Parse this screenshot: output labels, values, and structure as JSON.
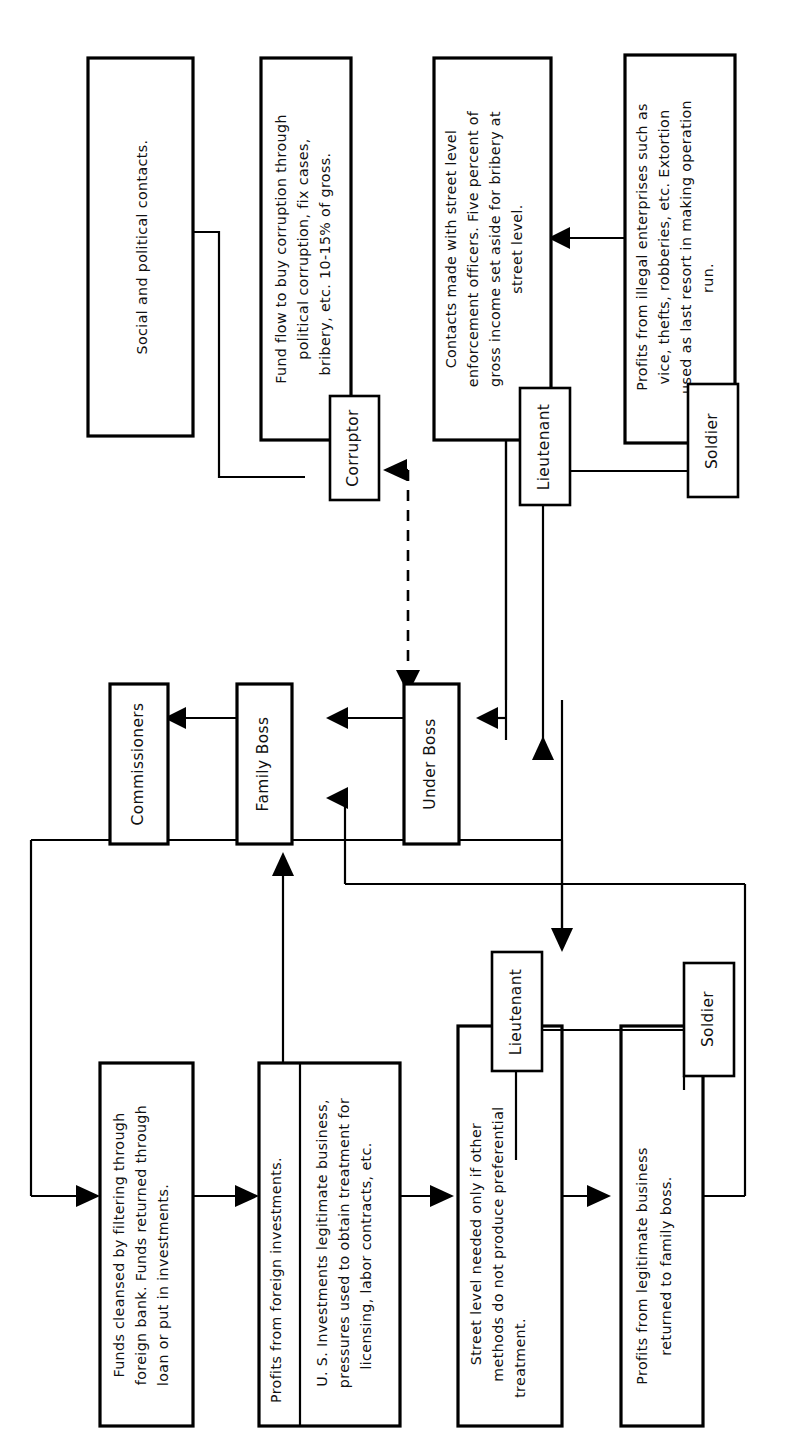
{
  "diagram": {
    "orientation": "rotated-90-ccw",
    "stroke_color": "#000000",
    "fill_color": "#ffffff",
    "background": "#ffffff"
  },
  "nodes": {
    "social_contacts": {
      "id": "social-contacts",
      "text": "Social and political contacts."
    },
    "fund_flow": {
      "id": "fund-flow",
      "lines": [
        "Fund flow to buy corruption through",
        "political corruption, fix cases,",
        "bribery, etc.  10-15% of gross."
      ]
    },
    "corruptor": {
      "id": "corruptor",
      "text": "Corruptor"
    },
    "contacts_street": {
      "id": "contacts-street-level",
      "lines": [
        "Contacts made with street level",
        "enforcement officers.  Five percent of",
        "gross income set aside for bribery at",
        "street level."
      ]
    },
    "lieutenant_top": {
      "id": "lieutenant-illegal",
      "text": "Lieutenant"
    },
    "illegal_profits": {
      "id": "illegal-enterprise-profits",
      "lines": [
        "Profits from illegal enterprises such as",
        "vice, thefts, robberies, etc.  Extortion",
        "used as last resort in making operation",
        "run."
      ]
    },
    "soldier_top": {
      "id": "soldier-illegal",
      "text": "Soldier"
    },
    "commissioners": {
      "id": "commissioners",
      "text": "Commissioners"
    },
    "family_boss": {
      "id": "family-boss",
      "text": "Family Boss"
    },
    "under_boss": {
      "id": "under-boss",
      "text": "Under Boss"
    },
    "funds_cleansed": {
      "id": "funds-cleansed",
      "lines": [
        "Funds cleansed by filtering through",
        "foreign bank.  Funds returned through",
        "loan or put in investments."
      ]
    },
    "foreign_profits": {
      "id": "foreign-investment-profits",
      "text": "Profits from foreign investments."
    },
    "us_investments": {
      "id": "us-investments",
      "lines": [
        "U. S. Investments legitimate business,",
        "pressures used to obtain treatment for",
        "licensing, labor contracts,  etc."
      ]
    },
    "street_level_needed": {
      "id": "street-level-needed",
      "lines": [
        "Street level needed only if other",
        "methods do not produce preferential",
        "treatment."
      ]
    },
    "lieutenant_bottom": {
      "id": "lieutenant-legitimate",
      "text": "Lieutenant"
    },
    "legit_profits": {
      "id": "legitimate-business-profits",
      "lines": [
        "Profits from legitimate business",
        "returned to family boss."
      ]
    },
    "soldier_bottom": {
      "id": "soldier-legitimate",
      "text": "Soldier"
    }
  },
  "edges": [
    {
      "id": "soldier-top-to-contacts",
      "from": "soldier-illegal",
      "to": "contacts-street-level",
      "style": "solid",
      "arrow": "single"
    },
    {
      "id": "corruptor-underboss",
      "from": "under-boss",
      "to": "corruptor",
      "style": "dashed",
      "arrow": "double"
    },
    {
      "id": "soldier-top-to-lieutenant-top",
      "from": "soldier-illegal",
      "to": "lieutenant-illegal",
      "style": "solid",
      "arrow": "none"
    },
    {
      "id": "lieutenant-top-to-underboss",
      "from": "lieutenant-illegal",
      "to": "under-boss",
      "style": "solid",
      "arrow": "single"
    },
    {
      "id": "underboss-to-familyboss",
      "from": "under-boss",
      "to": "family-boss",
      "style": "solid",
      "arrow": "single"
    },
    {
      "id": "familyboss-to-commissioners",
      "from": "family-boss",
      "to": "commissioners",
      "style": "solid",
      "arrow": "single"
    },
    {
      "id": "underboss-to-lieutenant-bottom",
      "from": "under-boss",
      "to": "lieutenant-legitimate",
      "style": "solid",
      "arrow": "single"
    },
    {
      "id": "legit-profits-to-familyboss",
      "from": "legitimate-business-profits",
      "to": "family-boss",
      "style": "solid",
      "arrow": "single"
    },
    {
      "id": "commissioners-to-funds",
      "from": "commissioners",
      "to": "funds-cleansed",
      "style": "solid",
      "arrow": "single"
    },
    {
      "id": "funds-to-foreign-profits",
      "from": "funds-cleansed",
      "to": "foreign-investment-profits",
      "style": "solid",
      "arrow": "single"
    },
    {
      "id": "foreign-profits-to-street-level",
      "from": "us-investments",
      "to": "street-level-needed",
      "style": "solid",
      "arrow": "single"
    },
    {
      "id": "street-level-to-legit-profits",
      "from": "street-level-needed",
      "to": "legitimate-business-profits",
      "style": "solid",
      "arrow": "single"
    },
    {
      "id": "foreign-profits-to-familyboss",
      "from": "foreign-investment-profits",
      "to": "family-boss",
      "style": "solid",
      "arrow": "single"
    },
    {
      "id": "lieutenant-bottom-to-soldier-bottom",
      "from": "lieutenant-legitimate",
      "to": "soldier-legitimate",
      "style": "solid",
      "arrow": "none"
    }
  ]
}
